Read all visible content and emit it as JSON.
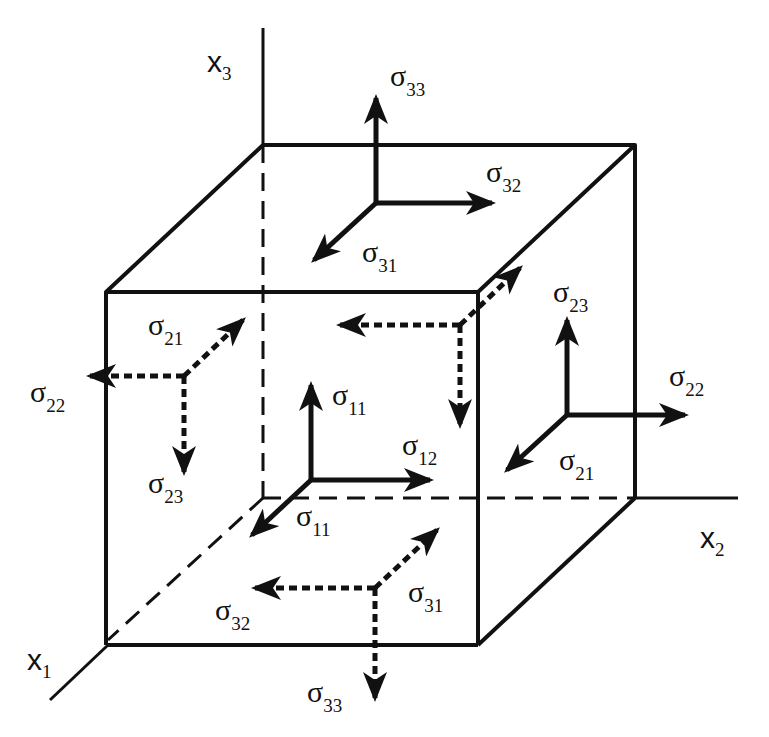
{
  "figure": {
    "type": "stress-tensor-cube",
    "axes": {
      "x1": {
        "label": "x",
        "sub": "1"
      },
      "x2": {
        "label": "x",
        "sub": "2"
      },
      "x3": {
        "label": "x",
        "sub": "3"
      }
    },
    "symbol": "σ",
    "faces": {
      "top_visible": {
        "normal": {
          "sub": "33"
        },
        "shear_a": {
          "sub": "32"
        },
        "shear_b": {
          "sub": "31"
        }
      },
      "front_visible": {
        "normal": {
          "sub": "11"
        },
        "shear_a": {
          "sub": "12"
        },
        "shear_b": {
          "sub": "11"
        }
      },
      "right_visible": {
        "normal": {
          "sub": "22"
        },
        "shear_a": {
          "sub": "23"
        },
        "shear_b": {
          "sub": "21"
        }
      },
      "left_hidden": {
        "normal": {
          "sub": "22"
        },
        "shear_a": {
          "sub": "21"
        },
        "shear_b": {
          "sub": "23"
        }
      },
      "back_hidden": {
        "shear_a": {
          "sub": "23"
        }
      },
      "bottom_hidden": {
        "normal": {
          "sub": "33"
        },
        "shear_a": {
          "sub": "32"
        },
        "shear_b": {
          "sub": "31"
        }
      }
    },
    "line_color": "#111111",
    "background": "#ffffff"
  }
}
